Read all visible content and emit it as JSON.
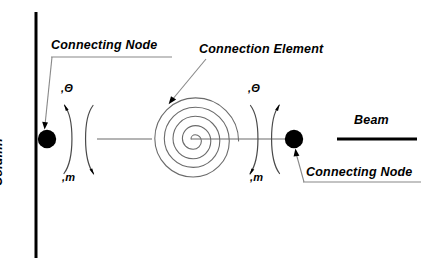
{
  "diagram": {
    "background_color": "#ffffff",
    "line_color": "#000000",
    "thin_line_color": "#555555",
    "node_fill_color": "#000000",
    "width": 425,
    "height": 273
  },
  "labels": {
    "connecting_node_top": "Connecting Node",
    "connection_element": "Connection Element",
    "beam": "Beam",
    "connecting_node_bottom": "Connecting Node",
    "column": "Column"
  },
  "symbols": {
    "theta_left": ",Θ",
    "theta_right": ",Θ",
    "m_left": ",m",
    "m_right": ",m",
    "theta_character": "Θ",
    "m_character": "m",
    "comma_character": ","
  },
  "elements": {
    "column_line": {
      "name": "Column",
      "orientation": "vertical",
      "x": 36,
      "y_top": 12,
      "y_bottom": 258,
      "stroke_width": 3
    },
    "beam_line": {
      "name": "Beam",
      "orientation": "horizontal",
      "y": 139,
      "x_start": 337,
      "x_end": 417,
      "stroke_width": 3
    },
    "left_node": {
      "name": "Connecting Node",
      "cx": 47,
      "cy": 139,
      "r": 9,
      "fill": "#000000"
    },
    "right_node": {
      "name": "Connecting Node",
      "cx": 294,
      "cy": 139,
      "r": 9,
      "fill": "#000000"
    },
    "spiral": {
      "name": "Connection Element",
      "cx": 191,
      "cy": 139,
      "turns": 3,
      "outer_radius": 41,
      "stroke_width": 1
    },
    "connector_line": {
      "orientation": "horizontal",
      "y": 139,
      "x_start": 97,
      "x_end": 295,
      "stroke_width": 1
    }
  },
  "leaders": [
    {
      "for": "connecting-node-top",
      "from_x": 52,
      "from_y": 58,
      "to_x": 45,
      "to_y": 126,
      "arrowhead": true
    },
    {
      "for": "connection-element",
      "from_x": 205,
      "from_y": 60,
      "to_x": 171,
      "to_y": 101,
      "arrowhead": true
    },
    {
      "for": "connecting-node-bottom",
      "from_x": 305,
      "from_y": 182,
      "to_x": 296,
      "to_y": 152,
      "arrowhead": true
    }
  ],
  "underlines": [
    {
      "for": "connecting-node-top",
      "x_start": 51,
      "x_end": 172,
      "y": 57
    },
    {
      "for": "connecting-node-bottom",
      "x_start": 303,
      "x_end": 421,
      "y": 182
    }
  ],
  "rotation_arcs": {
    "description": "Paired curved arcs representing rotational springs at each node",
    "left_pair": {
      "x_center": 80,
      "y_top": 104,
      "y_bottom": 176
    },
    "right_pair": {
      "x_center": 262,
      "y_top": 104,
      "y_bottom": 176
    }
  }
}
